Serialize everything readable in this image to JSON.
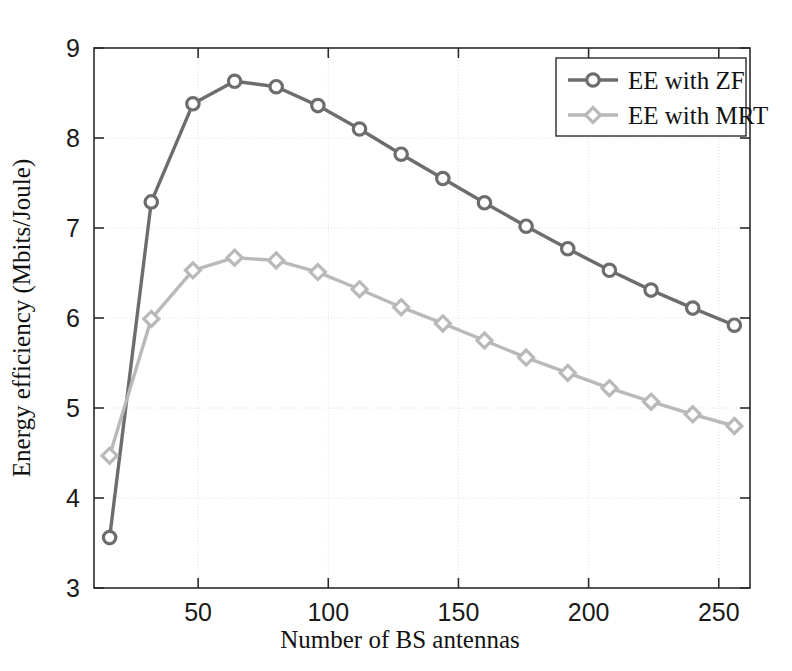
{
  "chart_data": {
    "type": "line",
    "title": "",
    "xlabel": "Number of BS antennas",
    "ylabel": "Energy efficiency (Mbits/Joule)",
    "xlim": [
      10,
      262
    ],
    "ylim": [
      3,
      9
    ],
    "xticks": [
      50,
      100,
      150,
      200,
      250
    ],
    "yticks": [
      3,
      4,
      5,
      6,
      7,
      8,
      9
    ],
    "xtick_labels": [
      "50",
      "100",
      "150",
      "200",
      "250"
    ],
    "ytick_labels": [
      "3",
      "4",
      "5",
      "6",
      "7",
      "8",
      "9"
    ],
    "grid": true,
    "legend_position": "top-right",
    "x": [
      16,
      32,
      48,
      64,
      80,
      96,
      112,
      128,
      144,
      160,
      176,
      192,
      208,
      224,
      240,
      256
    ],
    "series": [
      {
        "name": "EE with ZF",
        "color": "#6d6d6d",
        "marker": "circle",
        "values": [
          3.56,
          7.29,
          8.38,
          8.63,
          8.57,
          8.36,
          8.1,
          7.82,
          7.55,
          7.28,
          7.02,
          6.77,
          6.53,
          6.31,
          6.11,
          5.92
        ]
      },
      {
        "name": "EE with MRT",
        "color": "#b9b9b9",
        "marker": "diamond",
        "values": [
          4.47,
          5.99,
          6.53,
          6.67,
          6.64,
          6.51,
          6.32,
          6.12,
          5.94,
          5.75,
          5.56,
          5.39,
          5.22,
          5.07,
          4.93,
          4.8
        ]
      }
    ]
  },
  "legend": {
    "entries": [
      {
        "label": "EE with ZF"
      },
      {
        "label": "EE with MRT"
      }
    ]
  },
  "axes": {
    "x_title": "Number of BS antennas",
    "y_title": "Energy efficiency (Mbits/Joule)"
  }
}
